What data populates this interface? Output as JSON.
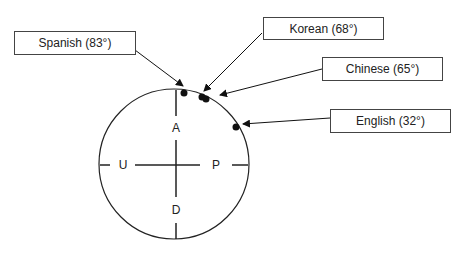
{
  "diagram": {
    "axes": {
      "top": "A",
      "bottom": "D",
      "left": "U",
      "right": "P"
    },
    "labels": [
      {
        "id": "spanish",
        "text": "Spanish (83°)"
      },
      {
        "id": "korean",
        "text": "Korean (68°)"
      },
      {
        "id": "chinese",
        "text": "Chinese (65°)"
      },
      {
        "id": "english",
        "text": "English (32°)"
      }
    ],
    "points": [
      {
        "language": "Spanish",
        "angle_deg": 83
      },
      {
        "language": "Korean",
        "angle_deg": 68
      },
      {
        "language": "Chinese",
        "angle_deg": 65
      },
      {
        "language": "English",
        "angle_deg": 32
      }
    ]
  }
}
